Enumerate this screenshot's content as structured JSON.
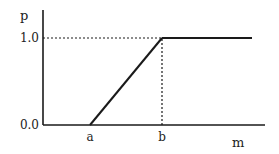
{
  "chart_data": {
    "type": "line",
    "title": "",
    "xlabel": "m",
    "ylabel": "p",
    "x_ticks": [
      {
        "label": "a",
        "value": "a"
      },
      {
        "label": "b",
        "value": "b"
      }
    ],
    "y_ticks": [
      {
        "label": "0.0",
        "value": 0.0
      },
      {
        "label": "1.0",
        "value": 1.0
      }
    ],
    "ylim": [
      0.0,
      1.0
    ],
    "series": [
      {
        "name": "p(m)",
        "style": "solid",
        "points": [
          {
            "x": "a",
            "y": 0.0
          },
          {
            "x": "b",
            "y": 1.0
          },
          {
            "x": "end",
            "y": 1.0
          }
        ]
      }
    ],
    "reference_lines": [
      {
        "name": "y=1.0 guide",
        "style": "dotted",
        "from": {
          "x": "origin",
          "y": 1.0
        },
        "to": {
          "x": "b",
          "y": 1.0
        }
      },
      {
        "name": "x=b guide",
        "style": "dotted",
        "from": {
          "x": "b",
          "y": 0.0
        },
        "to": {
          "x": "b",
          "y": 1.0
        }
      }
    ],
    "grid": false,
    "legend": "none"
  },
  "colors": {
    "line": "#1a1a1a",
    "background": "#ffffff"
  }
}
